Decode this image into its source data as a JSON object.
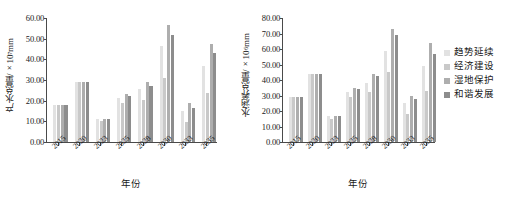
{
  "figure": {
    "legend": {
      "position": "right",
      "entries": [
        {
          "label": "趋势延续",
          "color": "#e2e2e2"
        },
        {
          "label": "经济建设",
          "color": "#c9c9c9"
        },
        {
          "label": "湿地保护",
          "color": "#aeaeae"
        },
        {
          "label": "和谐发展",
          "color": "#8d8d8d"
        }
      ]
    }
  },
  "chart_data": [
    {
      "type": "bar",
      "panel": "left",
      "title": "",
      "xlabel": "年份",
      "ylabel": "产水总量/×10⁷mm",
      "ylabel_main": "产水总量/×10",
      "ylabel_exp": "7",
      "ylabel_unit": "mm",
      "ylim": [
        0,
        60
      ],
      "yticks": [
        "0.00",
        "10.00",
        "20.00",
        "30.00",
        "40.00",
        "50.00",
        "60.00"
      ],
      "ytick_values": [
        0,
        10,
        20,
        30,
        40,
        50,
        60
      ],
      "grid": false,
      "categories": [
        "2015",
        "2020",
        "2023",
        "2025",
        "2028",
        "2030",
        "2033",
        "2035"
      ],
      "series": [
        {
          "name": "趋势延续",
          "color": "#e2e2e2",
          "values": [
            18.0,
            29.0,
            11.0,
            21.5,
            25.5,
            46.5,
            15.0,
            37.0
          ]
        },
        {
          "name": "经济建设",
          "color": "#c9c9c9",
          "values": [
            18.0,
            29.0,
            10.2,
            19.0,
            20.5,
            31.0,
            9.5,
            23.5
          ]
        },
        {
          "name": "湿地保护",
          "color": "#aeaeae",
          "values": [
            18.0,
            29.0,
            11.2,
            23.0,
            29.0,
            56.5,
            19.0,
            47.5
          ]
        },
        {
          "name": "和谐发展",
          "color": "#8d8d8d",
          "values": [
            18.0,
            29.0,
            11.0,
            22.5,
            27.0,
            52.0,
            16.5,
            43.0
          ]
        }
      ]
    },
    {
      "type": "bar",
      "panel": "right",
      "title": "",
      "xlabel": "年份",
      "ylabel": "水涵养总量/×10⁶mm",
      "ylabel_main": "水涵养总量/×10",
      "ylabel_exp": "6",
      "ylabel_unit": "mm",
      "ylim": [
        0,
        80
      ],
      "yticks": [
        "0.00",
        "10.00",
        "20.00",
        "30.00",
        "40.00",
        "50.00",
        "60.00",
        "70.00",
        "80.00"
      ],
      "ytick_values": [
        0,
        10,
        20,
        30,
        40,
        50,
        60,
        70,
        80
      ],
      "grid": false,
      "categories": [
        "2015",
        "2020",
        "2023",
        "2025",
        "2028",
        "2030",
        "2033",
        "2035"
      ],
      "series": [
        {
          "name": "趋势延续",
          "color": "#e2e2e2",
          "values": [
            29.0,
            44.0,
            16.5,
            32.0,
            38.0,
            59.0,
            25.0,
            49.0
          ]
        },
        {
          "name": "经济建设",
          "color": "#c9c9c9",
          "values": [
            29.0,
            44.0,
            15.0,
            29.0,
            32.0,
            45.0,
            18.0,
            33.0
          ]
        },
        {
          "name": "湿地保护",
          "color": "#aeaeae",
          "values": [
            29.0,
            44.0,
            17.0,
            35.0,
            44.0,
            73.0,
            30.0,
            64.0
          ]
        },
        {
          "name": "和谐发展",
          "color": "#8d8d8d",
          "values": [
            29.0,
            44.0,
            17.0,
            34.0,
            42.5,
            69.0,
            28.0,
            57.0
          ]
        }
      ]
    }
  ]
}
